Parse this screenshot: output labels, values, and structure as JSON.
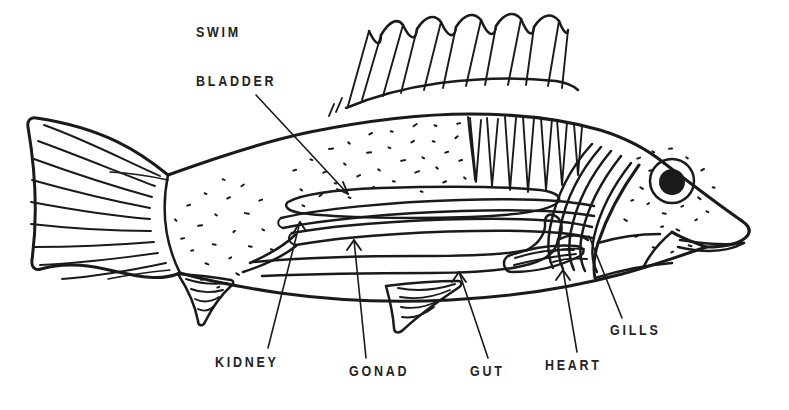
{
  "figure": {
    "kind": "line-drawing",
    "background_color": "#ffffff",
    "ink_color": "#1a1a1a",
    "label_color": "#232323"
  },
  "labels": [
    {
      "id": "swim-bladder",
      "line1": "SWIM",
      "line2": "BLADDER"
    },
    {
      "id": "kidney",
      "text": "KIDNEY"
    },
    {
      "id": "gonad",
      "text": "GONAD"
    },
    {
      "id": "gut",
      "text": "GUT"
    },
    {
      "id": "heart",
      "text": "HEART"
    },
    {
      "id": "gills",
      "text": "GILLS"
    }
  ],
  "label_text": {
    "swim": "SWIM",
    "bladder": "BLADDER",
    "kidney": "KIDNEY",
    "gonad": "GONAD",
    "gut": "GUT",
    "heart": "HEART",
    "gills": "GILLS"
  },
  "anatomy_parts": [
    "swim bladder",
    "kidney",
    "gonad",
    "gut",
    "heart",
    "gills"
  ],
  "external_features": [
    "caudal fin",
    "dorsal fin with spines",
    "pectoral fin",
    "pelvic fin",
    "anal fin",
    "eye",
    "mouth",
    "operculum"
  ]
}
